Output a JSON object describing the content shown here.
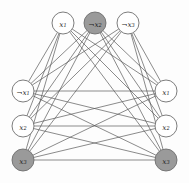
{
  "diagram": {
    "type": "graph",
    "canvas": {
      "width": 189,
      "height": 183
    },
    "colors": {
      "background": "#fdfdfd",
      "node_fill_default": "#ffffff",
      "node_fill_highlight": "#9a9a9a",
      "node_stroke": "#6e6e6e",
      "edge_stroke": "#595959",
      "label_color": "#1a1a1a"
    },
    "node_radius": 11,
    "nodes": [
      {
        "id": "n0",
        "label": "x1",
        "neg": false,
        "var": "x",
        "sub": "1",
        "cx": 63,
        "cy": 23,
        "highlight": false,
        "fill": "#ffffff"
      },
      {
        "id": "n1",
        "label": "¬x2",
        "neg": true,
        "var": "x",
        "sub": "2",
        "cx": 95,
        "cy": 23,
        "highlight": true,
        "fill": "#9a9a9a"
      },
      {
        "id": "n2",
        "label": "¬x3",
        "neg": true,
        "var": "x",
        "sub": "3",
        "cx": 128,
        "cy": 23,
        "highlight": false,
        "fill": "#ffffff"
      },
      {
        "id": "n3",
        "label": "x1",
        "neg": false,
        "var": "x",
        "sub": "1",
        "cx": 166,
        "cy": 91,
        "highlight": false,
        "fill": "#ffffff"
      },
      {
        "id": "n4",
        "label": "x2",
        "neg": false,
        "var": "x",
        "sub": "2",
        "cx": 166,
        "cy": 126,
        "highlight": false,
        "fill": "#ffffff"
      },
      {
        "id": "n5",
        "label": "x3",
        "neg": false,
        "var": "x",
        "sub": "3",
        "cx": 166,
        "cy": 160,
        "highlight": true,
        "fill": "#9a9a9a"
      },
      {
        "id": "n6",
        "label": "x3",
        "neg": false,
        "var": "x",
        "sub": "3",
        "cx": 23,
        "cy": 160,
        "highlight": true,
        "fill": "#9a9a9a"
      },
      {
        "id": "n7",
        "label": "x2",
        "neg": false,
        "var": "x",
        "sub": "2",
        "cx": 23,
        "cy": 126,
        "highlight": false,
        "fill": "#ffffff"
      },
      {
        "id": "n8",
        "label": "¬x1",
        "neg": true,
        "var": "x",
        "sub": "1",
        "cx": 23,
        "cy": 91,
        "highlight": false,
        "fill": "#ffffff"
      }
    ],
    "edges": [
      [
        "n0",
        "n3"
      ],
      [
        "n0",
        "n4"
      ],
      [
        "n0",
        "n5"
      ],
      [
        "n0",
        "n6"
      ],
      [
        "n0",
        "n7"
      ],
      [
        "n0",
        "n8"
      ],
      [
        "n1",
        "n3"
      ],
      [
        "n1",
        "n4"
      ],
      [
        "n1",
        "n5"
      ],
      [
        "n1",
        "n6"
      ],
      [
        "n1",
        "n7"
      ],
      [
        "n1",
        "n8"
      ],
      [
        "n2",
        "n3"
      ],
      [
        "n2",
        "n4"
      ],
      [
        "n2",
        "n5"
      ],
      [
        "n2",
        "n6"
      ],
      [
        "n2",
        "n7"
      ],
      [
        "n2",
        "n8"
      ],
      [
        "n8",
        "n3"
      ],
      [
        "n8",
        "n4"
      ],
      [
        "n8",
        "n5"
      ],
      [
        "n7",
        "n3"
      ],
      [
        "n7",
        "n4"
      ],
      [
        "n7",
        "n5"
      ],
      [
        "n6",
        "n3"
      ],
      [
        "n6",
        "n4"
      ],
      [
        "n6",
        "n5"
      ]
    ]
  }
}
